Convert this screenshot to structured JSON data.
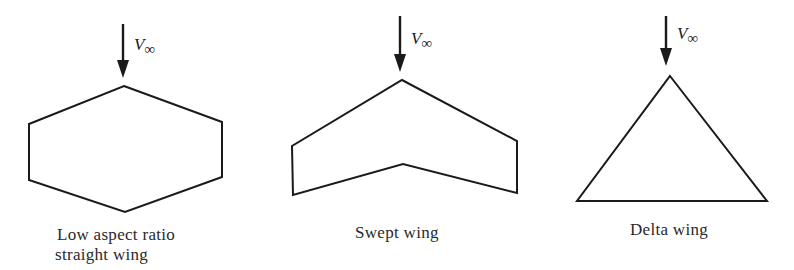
{
  "figure": {
    "stroke_color": "#1a1a1a",
    "background": "#ffffff",
    "panels": [
      {
        "id": "low-aspect-ratio",
        "flow_label": {
          "symbol": "V",
          "subscript": "∞"
        },
        "caption_lines": [
          "Low aspect ratio",
          "straight wing"
        ],
        "arrow": {
          "x": 123,
          "y1": 24,
          "y2": 78
        },
        "outline_points": "124,86 222,122 222,177 125,212 29,180 29,124"
      },
      {
        "id": "swept",
        "flow_label": {
          "symbol": "V",
          "subscript": "∞"
        },
        "caption_lines": [
          "Swept wing"
        ],
        "arrow": {
          "x": 400,
          "y1": 16,
          "y2": 72
        },
        "outline_points": "402,80 517,141 517,193 403,164 293,195 292,146"
      },
      {
        "id": "delta",
        "flow_label": {
          "symbol": "V",
          "subscript": "∞"
        },
        "caption_lines": [
          "Delta wing"
        ],
        "arrow": {
          "x": 666,
          "y1": 16,
          "y2": 66
        },
        "outline_points": "670,76 767,201 577,201"
      }
    ]
  }
}
